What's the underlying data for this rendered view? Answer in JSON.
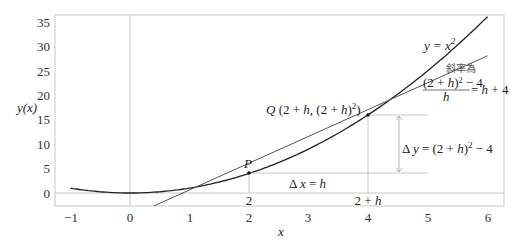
{
  "chart_data": {
    "type": "line",
    "title": "",
    "xlabel": "x",
    "ylabel": "y(x)",
    "xlim": [
      -1.25,
      6.3
    ],
    "ylim": [
      -2.6,
      36.5
    ],
    "x_ticks": [
      -1,
      0,
      1,
      2,
      3,
      4,
      5,
      6
    ],
    "x_tick_labels": [
      "−1",
      "0",
      "1",
      "2",
      "3",
      "4",
      "5",
      "6"
    ],
    "y_ticks": [
      0,
      5,
      10,
      15,
      20,
      25,
      30,
      35
    ],
    "y_tick_labels": [
      "0",
      "5",
      "10",
      "15",
      "20",
      "25",
      "30",
      "35"
    ],
    "grid": false,
    "series": [
      {
        "name": "y = x^2",
        "type": "curve",
        "function": "x^2",
        "x_range": [
          -1,
          6
        ],
        "color": "#222222"
      },
      {
        "name": "secant line through P and Q",
        "type": "line",
        "slope": 6,
        "intercept": -8,
        "x_range": [
          0.4,
          6
        ],
        "color": "#555555"
      }
    ],
    "points": [
      {
        "name": "P",
        "x": 2,
        "y": 4
      },
      {
        "name": "Q",
        "x": 4,
        "y": 16
      }
    ],
    "annotations": {
      "curve_label": "y = x",
      "curve_label_sup": "2",
      "slope_title": "斜率為",
      "slope_numerator": "(2 + h)² − 4",
      "slope_denominator": "h",
      "slope_result": "= h + 4",
      "point_p": "P",
      "point_q": "Q (2 + h, (2 + h)²)",
      "delta_x": "Δ x = h",
      "delta_y": "Δ y = (2 + h)² − 4",
      "x_mark_p": "2",
      "x_mark_q": "2 + h"
    }
  }
}
